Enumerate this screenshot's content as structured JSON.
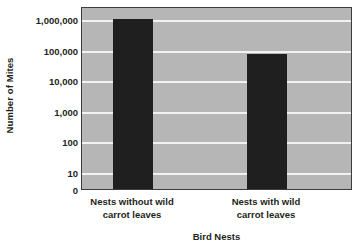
{
  "chart_data": {
    "type": "bar",
    "title": "",
    "xlabel": "Bird Nests",
    "ylabel": "Number of Mites",
    "categories": [
      "Nests without wild carrot leaves",
      "Nests with wild carrot leaves"
    ],
    "category_lines": [
      [
        "Nests without wild",
        "carrot leaves"
      ],
      [
        "Nests with wild",
        "carrot leaves"
      ]
    ],
    "values": [
      1000000,
      70000
    ],
    "yscale": "log",
    "ylim": [
      0,
      1000000
    ],
    "ytick_labels": [
      "1,000,000",
      "100,000",
      "10,000",
      "1,000",
      "100",
      "10",
      "0"
    ],
    "ytick_values": [
      1000000,
      100000,
      10000,
      1000,
      100,
      10,
      0
    ],
    "grid": true,
    "legend": "none",
    "colors": {
      "bar": "#201f1f",
      "plot_background": "#b6b6b6",
      "gridline": "#f2f2f2",
      "axis_border": "#3c3c3c",
      "text": "#231f20",
      "page_background": "#ffffff"
    }
  }
}
